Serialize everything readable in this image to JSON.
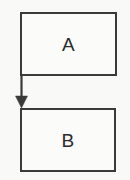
{
  "diagram": {
    "title": "",
    "type": "flowchart",
    "background_color": "#f9f9f7",
    "stroke_color": "#3a3a3a",
    "text_color": "#2b2b2b",
    "nodes": [
      {
        "id": "a",
        "label": "A",
        "shape": "rectangle",
        "x": 20,
        "y": 12,
        "width": 97,
        "height": 64
      },
      {
        "id": "b",
        "label": "B",
        "shape": "rectangle",
        "x": 20,
        "y": 108,
        "width": 96,
        "height": 64
      }
    ],
    "edges": [
      {
        "id": "a-to-b",
        "from": "a",
        "to": "b",
        "label": "",
        "arrowhead": "filled-triangle",
        "direction": "down",
        "from_x": 21,
        "from_y": 76,
        "to_x": 21,
        "to_y": 108
      }
    ]
  }
}
